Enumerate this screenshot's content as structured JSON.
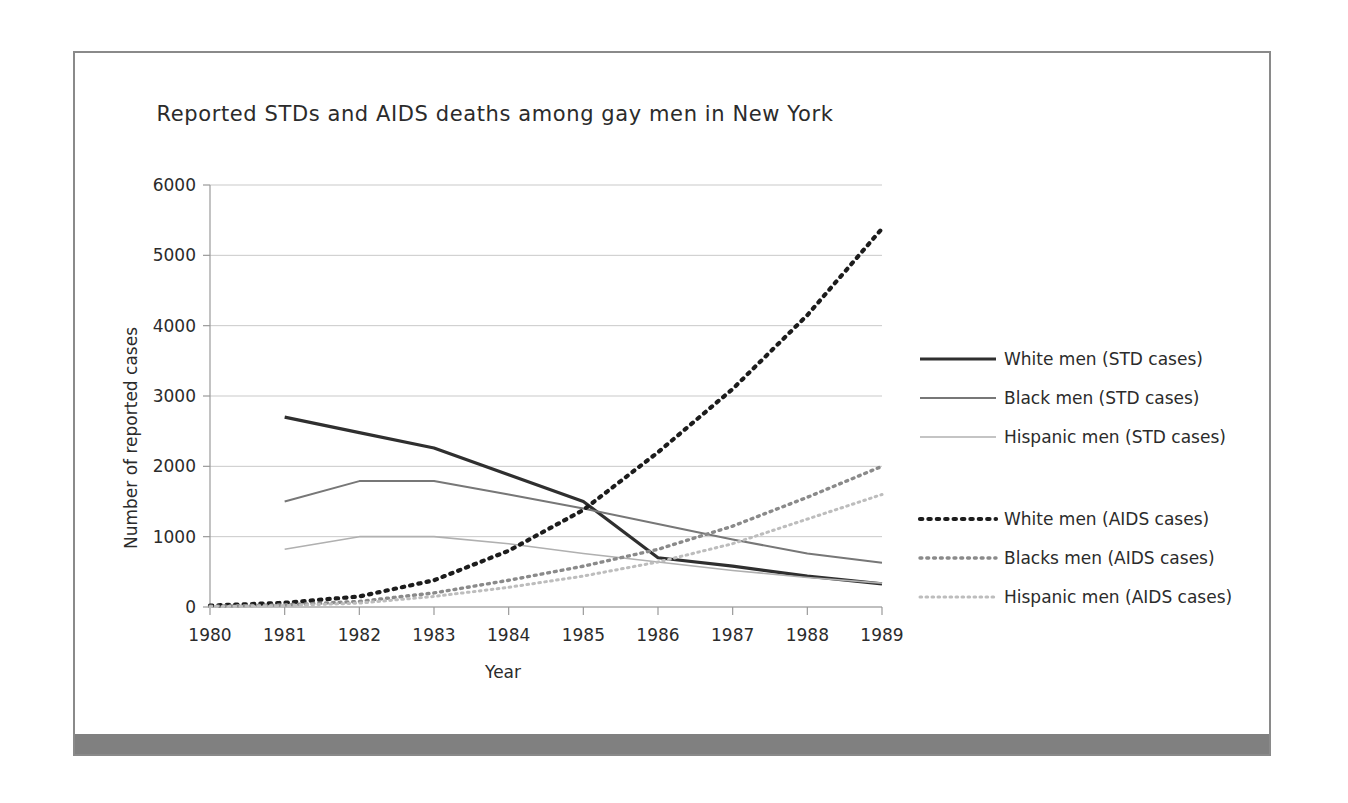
{
  "chart_data": {
    "type": "line",
    "title": "Reported STDs and AIDS deaths among gay men in New York",
    "xlabel": "Year",
    "ylabel": "Number of reported cases",
    "categories": [
      "1980",
      "1981",
      "1982",
      "1983",
      "1984",
      "1985",
      "1986",
      "1987",
      "1988",
      "1989"
    ],
    "x": [
      1980,
      1981,
      1982,
      1983,
      1984,
      1985,
      1986,
      1987,
      1988,
      1989
    ],
    "xlim": [
      1980,
      1989
    ],
    "ylim": [
      0,
      6000
    ],
    "yticks": [
      "0",
      "1000",
      "2000",
      "3000",
      "4000",
      "5000",
      "6000"
    ],
    "ytick_values": [
      0,
      1000,
      2000,
      3000,
      4000,
      5000,
      6000
    ],
    "grid": true,
    "legend_position": "right",
    "series": [
      {
        "name": "White men (STD cases)",
        "style": "solid",
        "color": "#2f2f2f",
        "width": 3.2,
        "x": [
          1981,
          1982,
          1983,
          1984,
          1985,
          1986,
          1987,
          1988,
          1989
        ],
        "values": [
          2700,
          2480,
          2260,
          1880,
          1500,
          700,
          580,
          440,
          330
        ]
      },
      {
        "name": "Black men (STD cases)",
        "style": "solid",
        "color": "#777777",
        "width": 2.0,
        "x": [
          1981,
          1982,
          1983,
          1984,
          1985,
          1986,
          1987,
          1988,
          1989
        ],
        "values": [
          1500,
          1790,
          1790,
          1600,
          1400,
          1180,
          960,
          760,
          630
        ]
      },
      {
        "name": "Hispanic men (STD cases)",
        "style": "solid",
        "color": "#b0b0b0",
        "width": 1.6,
        "x": [
          1981,
          1982,
          1983,
          1984,
          1985,
          1986,
          1987,
          1988,
          1989
        ],
        "values": [
          820,
          1000,
          1000,
          900,
          760,
          640,
          520,
          420,
          340
        ]
      },
      {
        "name": "White men (AIDS cases)",
        "style": "dotted",
        "color": "#1c1c1c",
        "width": 4.2,
        "x": [
          1980,
          1981,
          1982,
          1983,
          1984,
          1985,
          1986,
          1987,
          1988,
          1989
        ],
        "values": [
          20,
          60,
          150,
          380,
          800,
          1380,
          2200,
          3100,
          4150,
          5380
        ]
      },
      {
        "name": "Blacks men (AIDS cases)",
        "style": "dotted",
        "color": "#8a8a8a",
        "width": 3.4,
        "x": [
          1980,
          1981,
          1982,
          1983,
          1984,
          1985,
          1986,
          1987,
          1988,
          1989
        ],
        "values": [
          10,
          30,
          80,
          200,
          380,
          580,
          820,
          1150,
          1560,
          2000
        ]
      },
      {
        "name": "Hispanic men (AIDS cases)",
        "style": "dotted",
        "color": "#bdbdbd",
        "width": 3.0,
        "x": [
          1980,
          1981,
          1982,
          1983,
          1984,
          1985,
          1986,
          1987,
          1988,
          1989
        ],
        "values": [
          5,
          20,
          55,
          150,
          280,
          440,
          640,
          900,
          1250,
          1600
        ]
      }
    ]
  }
}
